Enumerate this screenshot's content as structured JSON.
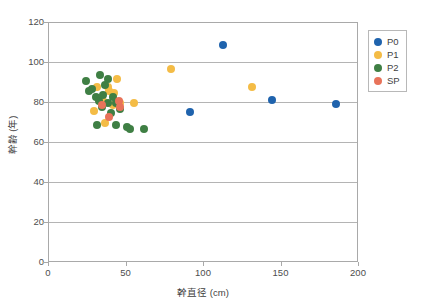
{
  "chart_data": {
    "type": "scatter",
    "title": "",
    "xlabel": "幹直径 (cm)",
    "ylabel": "幹齢 (年)",
    "xlim": [
      0,
      200
    ],
    "ylim": [
      0,
      120
    ],
    "xticks": [
      0,
      50,
      100,
      150,
      200
    ],
    "yticks": [
      0,
      20,
      40,
      60,
      80,
      100,
      120
    ],
    "grid": "horizontal",
    "legend_position": "right",
    "colors": {
      "P0": "#1f63ad",
      "P1": "#f4bc46",
      "P2": "#3f7f44",
      "SP": "#e8735a"
    },
    "series": [
      {
        "name": "P0",
        "color": "#1f63ad",
        "points": [
          [
            112,
            109
          ],
          [
            91,
            75.5
          ],
          [
            144,
            81.5
          ],
          [
            185,
            79.5
          ]
        ]
      },
      {
        "name": "P1",
        "color": "#f4bc46",
        "points": [
          [
            29,
            76
          ],
          [
            31,
            88
          ],
          [
            35,
            81
          ],
          [
            38,
            88
          ],
          [
            39,
            86
          ],
          [
            42,
            85
          ],
          [
            41,
            79
          ],
          [
            44,
            92
          ],
          [
            36,
            70
          ],
          [
            55,
            80
          ],
          [
            46,
            80
          ],
          [
            79,
            97
          ],
          [
            131,
            88
          ]
        ]
      },
      {
        "name": "P2",
        "color": "#3f7f44",
        "points": [
          [
            24,
            91
          ],
          [
            33,
            94
          ],
          [
            36,
            89
          ],
          [
            38,
            92
          ],
          [
            30,
            83
          ],
          [
            32,
            81
          ],
          [
            35,
            84
          ],
          [
            34,
            78
          ],
          [
            38,
            80
          ],
          [
            41,
            83
          ],
          [
            43,
            80
          ],
          [
            40,
            75
          ],
          [
            28,
            87
          ],
          [
            46,
            77
          ],
          [
            31,
            69
          ],
          [
            50,
            68
          ],
          [
            52,
            67
          ],
          [
            61,
            67
          ],
          [
            43,
            69
          ],
          [
            26,
            86
          ]
        ]
      },
      {
        "name": "SP",
        "color": "#e8735a",
        "points": [
          [
            34,
            79
          ],
          [
            45,
            81
          ],
          [
            46,
            78
          ],
          [
            39,
            73
          ]
        ]
      }
    ]
  },
  "legend": {
    "entries": [
      {
        "label": "P0",
        "color": "#1f63ad"
      },
      {
        "label": "P1",
        "color": "#f4bc46"
      },
      {
        "label": "P2",
        "color": "#3f7f44"
      },
      {
        "label": "SP",
        "color": "#e8735a"
      }
    ]
  }
}
